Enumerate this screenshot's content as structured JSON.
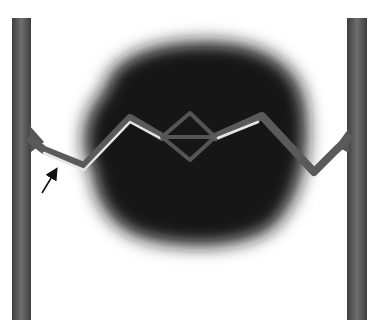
{
  "figure": {
    "colors": {
      "background": "#ffffff",
      "electrode": "#555555",
      "electrode_highlight": "#777777",
      "cloud": "#151515",
      "chain": "#5a5a5a",
      "chain_highlight": "#e6e6e6",
      "arrow": "#111111"
    },
    "electrodes": [
      {
        "name": "left",
        "x": 12,
        "y": 18,
        "width": 19,
        "height": 302
      },
      {
        "name": "right",
        "x": 347,
        "y": 18,
        "width": 20,
        "height": 302
      }
    ],
    "chain_points_left": [
      [
        31,
        136
      ],
      [
        44,
        150
      ],
      [
        84,
        167
      ],
      [
        130,
        118
      ],
      [
        162,
        137
      ]
    ],
    "chain_points_right": [
      [
        215,
        137
      ],
      [
        262,
        116
      ],
      [
        314,
        172
      ],
      [
        336,
        150
      ],
      [
        347,
        136
      ]
    ],
    "diamond": {
      "left": [
        162,
        137
      ],
      "top": [
        190,
        113
      ],
      "right": [
        215,
        137
      ],
      "bottom": [
        190,
        160
      ]
    },
    "arrow": {
      "from": [
        42,
        193
      ],
      "to": [
        58,
        167
      ]
    }
  }
}
